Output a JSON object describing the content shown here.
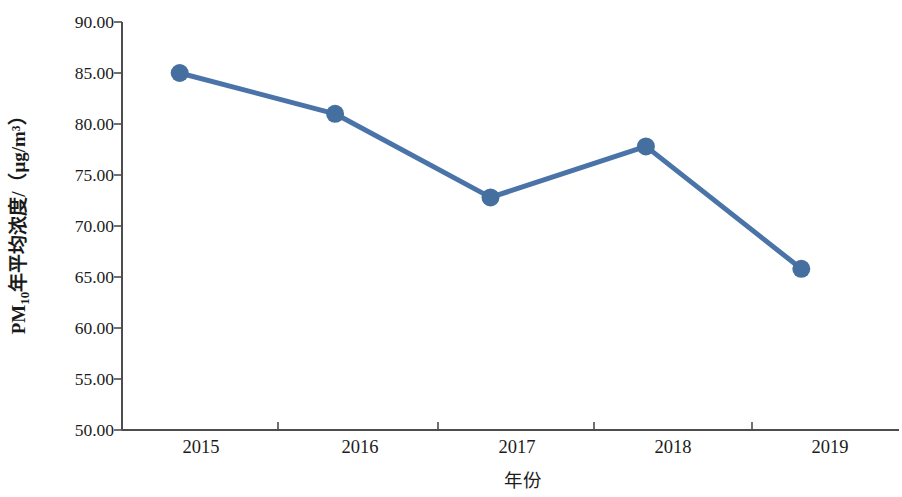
{
  "chart_data": {
    "type": "line",
    "title": "",
    "subtitle": "",
    "xlabel": "年份",
    "ylabel": "PM10年平均浓度/（μg/m³）",
    "ylabel_parts": {
      "prefix": "PM",
      "subscript": "10",
      "suffix": "年平均浓度/（μg/m³）"
    },
    "categories": [
      "2015",
      "2016",
      "2017",
      "2018",
      "2019"
    ],
    "x": [
      "2015",
      "2016",
      "2017",
      "2018",
      "2019"
    ],
    "values": [
      85.0,
      81.0,
      72.8,
      77.8,
      65.8
    ],
    "series": [
      {
        "name": "PM10年平均浓度",
        "values": [
          85.0,
          81.0,
          72.8,
          77.8,
          65.8
        ]
      }
    ],
    "ylim": [
      50.0,
      90.0
    ],
    "ytick_step": 5.0,
    "yticks": [
      90.0,
      85.0,
      80.0,
      75.0,
      70.0,
      65.0,
      60.0,
      55.0,
      50.0
    ],
    "ytick_labels": [
      "90.00",
      "85.00",
      "80.00",
      "75.00",
      "70.00",
      "65.00",
      "60.00",
      "55.00",
      "50.00"
    ],
    "xtick_labels": [
      "2015",
      "2016",
      "2017",
      "2018",
      "2019"
    ],
    "grid": false,
    "legend": false,
    "legend_position": "none",
    "marker": "circle",
    "annotations": []
  },
  "style": {
    "line_color": "#4a74a8",
    "marker_color": "#456f9f",
    "axis_color": "#4d4d4d",
    "text_color": "#1b1b1b",
    "background": "#ffffff"
  }
}
